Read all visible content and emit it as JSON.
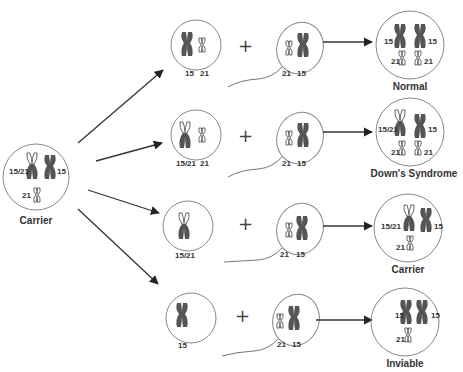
{
  "diagram": {
    "parent": {
      "caption": "Carrier",
      "labels": {
        "translocated": "15/21",
        "normal15": "15",
        "normal21": "21"
      }
    },
    "plus_symbol": "+",
    "rows": [
      {
        "egg_labels": [
          "15",
          "21"
        ],
        "sperm_labels": [
          "21",
          "15"
        ],
        "result_labels": {
          "left_top": "15",
          "right_top": "15",
          "left_bottom": "21",
          "right_bottom": "21"
        },
        "outcome": "Normal"
      },
      {
        "egg_labels": [
          "15/21",
          "21"
        ],
        "sperm_labels": [
          "21",
          "15"
        ],
        "result_labels": {
          "left_top": "15/21",
          "right_top": "15",
          "left_bottom": "21",
          "right_bottom": "21"
        },
        "outcome": "Down's Syndrome"
      },
      {
        "egg_labels": [
          "15/21"
        ],
        "sperm_labels": [
          "21",
          "15"
        ],
        "result_labels": {
          "left_top": "15/21",
          "right_top": "15",
          "left_bottom": "21"
        },
        "outcome": "Carrier"
      },
      {
        "egg_labels": [
          "15"
        ],
        "sperm_labels": [
          "21",
          "15"
        ],
        "result_labels": {
          "left_top": "15",
          "right_top": "15",
          "left_bottom": "21"
        },
        "outcome": "Inviable"
      }
    ],
    "colors": {
      "chromosome": "#555555",
      "outline": "#888888",
      "arrow": "#222222"
    }
  }
}
